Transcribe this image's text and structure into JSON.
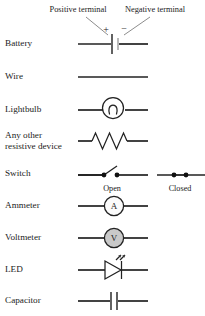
{
  "figure": {
    "background": "#ffffff",
    "ink": "#1c1c1c",
    "wire_color": "#222222"
  },
  "annotations": {
    "positive_terminal": "Positive terminal",
    "negative_terminal": "Negative terminal",
    "plus_sign": "+",
    "minus_sign": "−"
  },
  "switch_states": {
    "open": "Open",
    "closed": "Closed"
  },
  "meter_glyphs": {
    "ammeter": "A",
    "voltmeter": "V"
  },
  "rows": [
    {
      "label": "Battery",
      "symbol": "battery"
    },
    {
      "label": "Wire",
      "symbol": "wire"
    },
    {
      "label": "Lightbulb",
      "symbol": "lightbulb"
    },
    {
      "label_line1": "Any other",
      "label_line2": "resistive device",
      "symbol": "resistor"
    },
    {
      "label": "Switch",
      "symbol": "switch"
    },
    {
      "label": "Ammeter",
      "symbol": "ammeter"
    },
    {
      "label": "Voltmeter",
      "symbol": "voltmeter"
    },
    {
      "label": "LED",
      "symbol": "led"
    },
    {
      "label": "Capacitor",
      "symbol": "capacitor"
    }
  ]
}
